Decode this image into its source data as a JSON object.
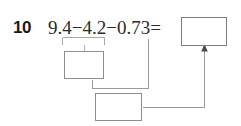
{
  "problem": {
    "number": "10",
    "equation": "9.4−4.2−0.73=",
    "operands": [
      "9.4",
      "4.2",
      "0.73"
    ],
    "operators": [
      "−",
      "−"
    ],
    "equals_sign": "=",
    "answer_value": "",
    "answer_placeholder": ""
  },
  "work_boxes": [
    {
      "id": "work-box-1",
      "value": "",
      "placeholder": ""
    },
    {
      "id": "work-box-2",
      "value": "",
      "placeholder": ""
    }
  ],
  "annotations": {
    "grouping_bracket_label": "",
    "arrow_label": ""
  },
  "icons": {
    "grouping_bracket": "under-bracket-icon",
    "arrow_up": "arrow-up-icon",
    "connector": "connector-line-icon"
  },
  "colors": {
    "page_background": "#ffffff",
    "number_text": "#1a1a1a",
    "equation_text": "#2b2b2b",
    "box_border": "#8e8e8e",
    "answer_box_border": "#7d7d7d",
    "connector_line": "#9a9a9a",
    "bracket_line": "#a8a8a8",
    "arrow_fill": "#4a4a4a"
  }
}
